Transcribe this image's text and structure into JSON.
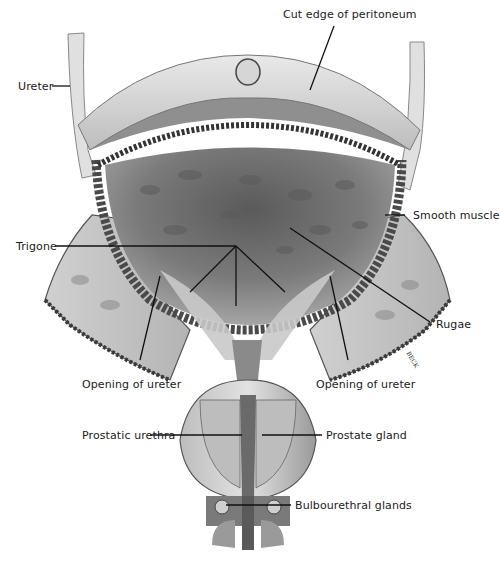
{
  "figure": {
    "artist_signature": "BECK"
  },
  "labels": {
    "ureter": "Ureter",
    "cut_edge_peritoneum": "Cut edge of peritoneum",
    "smooth_muscle": "Smooth muscle",
    "trigone": "Trigone",
    "rugae": "Rugae",
    "opening_ureter_left": "Opening of ureter",
    "opening_ureter_right": "Opening of ureter",
    "prostatic_urethra": "Prostatic urethra",
    "prostate_gland": "Prostate gland",
    "bulbourethral_glands": "Bulbourethral glands"
  },
  "colors": {
    "background": "#ffffff",
    "line": "#111111",
    "tissue_light": "#d9d9d9",
    "tissue_mid": "#a8a8a8",
    "tissue_dark": "#4a4a4a",
    "interior_dark": "#3a3a3a"
  }
}
